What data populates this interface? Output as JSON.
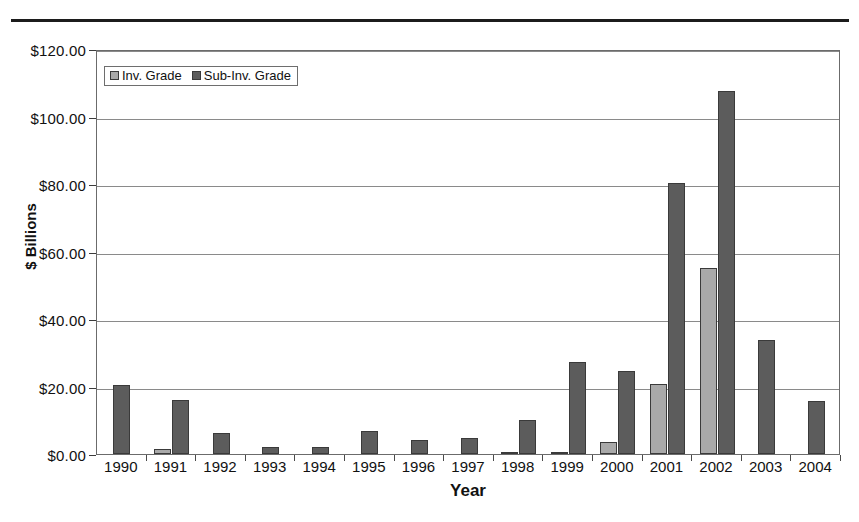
{
  "chart_data": {
    "type": "bar",
    "title": "",
    "xlabel": "Year",
    "ylabel": "$ Billions",
    "categories": [
      "1990",
      "1991",
      "1992",
      "1993",
      "1994",
      "1995",
      "1996",
      "1997",
      "1998",
      "1999",
      "2000",
      "2001",
      "2002",
      "2003",
      "2004"
    ],
    "series": [
      {
        "name": "Inv. Grade",
        "color": "#a9a9a9",
        "values": [
          0,
          1.4,
          0,
          0,
          0,
          0,
          0,
          0,
          0.4,
          0.6,
          3.5,
          20.8,
          55.2,
          0,
          0
        ]
      },
      {
        "name": "Sub-Inv. Grade",
        "color": "#5c5c5c",
        "values": [
          20.4,
          15.9,
          6.3,
          2.1,
          2.1,
          6.7,
          4.1,
          4.8,
          10.0,
          27.3,
          24.6,
          80.3,
          107.5,
          33.8,
          15.7
        ]
      }
    ],
    "ylim": [
      0,
      120
    ],
    "yticks": [
      0,
      20,
      40,
      60,
      80,
      100,
      120
    ],
    "ytick_labels": [
      "$0.00",
      "$20.00",
      "$40.00",
      "$60.00",
      "$80.00",
      "$100.00",
      "$120.00"
    ],
    "grid": true,
    "legend_position": "upper-left-inside"
  },
  "legend": {
    "items": [
      {
        "label": "Inv. Grade",
        "swatch": "inv-grade-swatch"
      },
      {
        "label": "Sub-Inv. Grade",
        "swatch": "sub-inv-grade-swatch"
      }
    ]
  }
}
